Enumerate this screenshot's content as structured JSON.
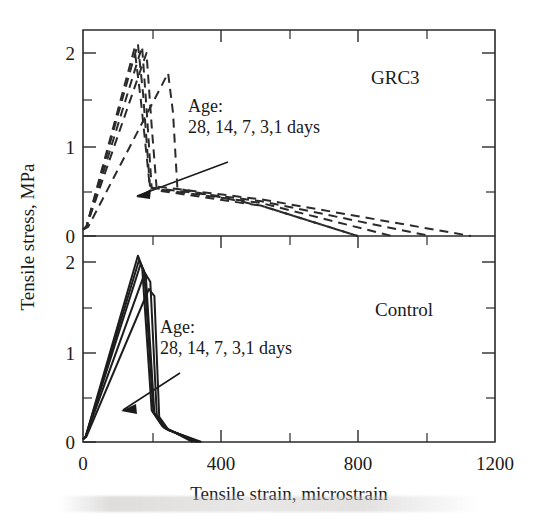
{
  "figure": {
    "axis": {
      "xlabel": "Tensile strain, microstrain",
      "ylabel": "Tensile stress, MPa",
      "x_ticklabels": [
        "0",
        "400",
        "800",
        "1200"
      ],
      "x_tickvalues": [
        0,
        400,
        800,
        1200
      ],
      "x_minor_step": 200,
      "y_ticklabels": [
        "0",
        "1",
        "2"
      ],
      "y_tickvalues": [
        0,
        1,
        2
      ],
      "y_minor_step": 0.5,
      "xlim": [
        0,
        1200
      ],
      "ylim": [
        0,
        2.35
      ],
      "grid": "off",
      "tick_direction": "in"
    },
    "panels": [
      {
        "id": "grc3",
        "label": "GRC3",
        "annotation_line1": "Age:",
        "annotation_line2": "28, 14, 7, 3,1 days",
        "linestyle": "dashed"
      },
      {
        "id": "control",
        "label": "Control",
        "annotation_line1": "Age:",
        "annotation_line2": "28, 14, 7, 3,1 days",
        "linestyle": "solid"
      }
    ],
    "colors": {
      "line": "#2b2b2b",
      "axis": "#2a2a2a",
      "text": "#1a1a1a",
      "background": "#ffffff"
    }
  },
  "chart_data": {
    "type": "line",
    "title": "",
    "xlabel": "Tensile strain, microstrain",
    "ylabel": "Tensile stress, MPa",
    "xlim": [
      0,
      1200
    ],
    "ylim": [
      0,
      2.35
    ],
    "grid": false,
    "legend": "none",
    "panels": [
      {
        "name": "GRC3",
        "linestyle": "dashed",
        "annotation": "Age: 28, 14, 7, 3,1 days",
        "arrow": {
          "from_x": 430,
          "from_y": 0.98,
          "to_x": 150,
          "to_y": 0.47,
          "meaning": "age decreasing from 28 days to 1 day"
        },
        "series": [
          {
            "name": "28 days",
            "x": [
              0,
              10,
              160,
              175,
              195,
              520,
              1130
            ],
            "y": [
              0.07,
              0.1,
              2.1,
              1.55,
              0.55,
              0.4,
              0.0
            ]
          },
          {
            "name": "14 days",
            "x": [
              0,
              10,
              150,
              168,
              195,
              520,
              1010
            ],
            "y": [
              0.07,
              0.1,
              2.05,
              1.5,
              0.53,
              0.38,
              0.0
            ]
          },
          {
            "name": "7 days",
            "x": [
              0,
              10,
              172,
              185,
              200,
              520,
              900
            ],
            "y": [
              0.07,
              0.1,
              2.07,
              1.4,
              0.52,
              0.36,
              0.0
            ]
          },
          {
            "name": "3 days",
            "x": [
              0,
              10,
              185,
              200,
              215,
              520,
              800
            ],
            "y": [
              0.07,
              0.1,
              2.0,
              1.2,
              0.5,
              0.33,
              0.0
            ]
          },
          {
            "name": "1 day",
            "x": [
              0,
              15,
              248,
              262,
              275,
              520,
              800
            ],
            "y": [
              0.07,
              0.1,
              1.78,
              1.35,
              0.52,
              0.33,
              0.0
            ]
          }
        ]
      },
      {
        "name": "Control",
        "linestyle": "solid",
        "annotation": "Age: 28, 14, 7, 3,1 days",
        "arrow": {
          "from_x": 300,
          "from_y": 0.92,
          "to_x": 140,
          "to_y": 0.43,
          "meaning": "age decreasing from 28 days to 1 day"
        },
        "series": [
          {
            "name": "28 days",
            "x": [
              0,
              8,
              160,
              172,
              200,
              230,
              320
            ],
            "y": [
              0.03,
              0.06,
              2.07,
              1.95,
              0.35,
              0.18,
              0.0
            ]
          },
          {
            "name": "14 days",
            "x": [
              0,
              8,
              163,
              178,
              205,
              235,
              330
            ],
            "y": [
              0.03,
              0.06,
              2.02,
              1.9,
              0.33,
              0.16,
              0.0
            ]
          },
          {
            "name": "7 days",
            "x": [
              0,
              8,
              168,
              183,
              208,
              240,
              335
            ],
            "y": [
              0.03,
              0.06,
              1.98,
              1.85,
              0.32,
              0.15,
              0.0
            ]
          },
          {
            "name": "3 days",
            "x": [
              0,
              8,
              180,
              196,
              215,
              245,
              340
            ],
            "y": [
              0.03,
              0.06,
              1.88,
              1.78,
              0.3,
              0.14,
              0.0
            ]
          },
          {
            "name": "1 day",
            "x": [
              0,
              10,
              192,
              208,
              222,
              250,
              345
            ],
            "y": [
              0.03,
              0.06,
              1.7,
              1.62,
              0.28,
              0.13,
              0.0
            ]
          }
        ]
      }
    ]
  }
}
